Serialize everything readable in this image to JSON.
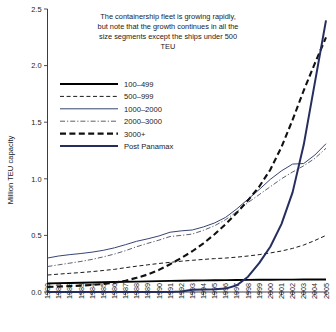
{
  "chart_data": {
    "type": "line",
    "title": "The containership fleet is growing rapidly, but note that the growth continues in all the size segments except the ships under 500 TEU",
    "title_lines": [
      "The containership fleet is growing rapidly,",
      "but note that the growth continues in all the",
      "size segments except the ships under 500",
      "TEU"
    ],
    "xlabel": "",
    "ylabel": "Million TEU capacity",
    "ylim": [
      0.0,
      2.5
    ],
    "ytick_labels": [
      "0.0",
      "0.5",
      "1.0",
      "1.5",
      "2.0",
      "2.5"
    ],
    "ytick_values": [
      0.0,
      0.5,
      1.0,
      1.5,
      2.0,
      2.5
    ],
    "grid": false,
    "legend_position": "upper-left",
    "x": [
      1980,
      1981,
      1982,
      1983,
      1984,
      1985,
      1986,
      1987,
      1988,
      1989,
      1990,
      1991,
      1992,
      1993,
      1994,
      1995,
      1996,
      1997,
      1998,
      1999,
      2000,
      2001,
      2002,
      2003,
      2004,
      2005
    ],
    "categories": [
      "1980",
      "1981",
      "1982",
      "1983",
      "1984",
      "1985",
      "1986",
      "1987",
      "1988",
      "1989",
      "1990",
      "1991",
      "1992",
      "1993",
      "1994",
      "1995",
      "1996",
      "1997",
      "1998",
      "1999",
      "2000",
      "2001",
      "2002",
      "2003",
      "2004",
      "2005"
    ],
    "series": [
      {
        "name": "100–499",
        "style": "solid-thick-black",
        "color": "#000000",
        "values": [
          0.075,
          0.078,
          0.08,
          0.082,
          0.084,
          0.086,
          0.088,
          0.09,
          0.092,
          0.094,
          0.096,
          0.098,
          0.1,
          0.102,
          0.103,
          0.104,
          0.105,
          0.106,
          0.107,
          0.108,
          0.108,
          0.109,
          0.109,
          0.11,
          0.11,
          0.11
        ]
      },
      {
        "name": "500–999",
        "style": "dashed-black",
        "color": "#1a1a1a",
        "values": [
          0.15,
          0.158,
          0.165,
          0.172,
          0.18,
          0.19,
          0.2,
          0.215,
          0.228,
          0.24,
          0.252,
          0.262,
          0.272,
          0.28,
          0.288,
          0.295,
          0.3,
          0.308,
          0.318,
          0.33,
          0.345,
          0.362,
          0.385,
          0.415,
          0.455,
          0.5
        ]
      },
      {
        "name": "1000–2000",
        "style": "solid-thin-navy",
        "color": "#2b3a6b",
        "values": [
          0.3,
          0.318,
          0.33,
          0.34,
          0.352,
          0.368,
          0.39,
          0.418,
          0.448,
          0.47,
          0.495,
          0.528,
          0.54,
          0.548,
          0.575,
          0.61,
          0.66,
          0.735,
          0.82,
          0.905,
          0.995,
          1.07,
          1.13,
          1.135,
          1.21,
          1.31
        ]
      },
      {
        "name": "2000–3000",
        "style": "dash-dot-gray",
        "color": "#555566",
        "values": [
          0.225,
          0.24,
          0.255,
          0.27,
          0.288,
          0.31,
          0.335,
          0.365,
          0.4,
          0.43,
          0.458,
          0.49,
          0.5,
          0.512,
          0.545,
          0.585,
          0.64,
          0.71,
          0.79,
          0.86,
          0.93,
          1.0,
          1.06,
          1.115,
          1.18,
          1.27
        ]
      },
      {
        "name": "3000+",
        "style": "dashed-thick-black",
        "color": "#111111",
        "values": [
          0.045,
          0.048,
          0.052,
          0.056,
          0.062,
          0.07,
          0.082,
          0.1,
          0.125,
          0.155,
          0.195,
          0.245,
          0.3,
          0.36,
          0.43,
          0.51,
          0.6,
          0.7,
          0.81,
          0.93,
          1.08,
          1.28,
          1.52,
          1.78,
          2.02,
          2.25
        ]
      },
      {
        "name": "Post Panamax",
        "style": "solid-thick-navy",
        "color": "#262e5e",
        "values": [
          0.0,
          0.0,
          0.0,
          0.0,
          0.0,
          0.0,
          0.0,
          0.0,
          0.0,
          0.0,
          0.0,
          0.0,
          0.005,
          0.02,
          0.022,
          0.024,
          0.03,
          0.06,
          0.135,
          0.255,
          0.4,
          0.6,
          0.88,
          1.3,
          1.85,
          2.4
        ]
      }
    ],
    "legend": [
      {
        "label": "100–499",
        "style": "solid-thick-black"
      },
      {
        "label": "500–999",
        "style": "dashed-black"
      },
      {
        "label": "1000–2000",
        "style": "solid-thin-navy"
      },
      {
        "label": "2000–3000",
        "style": "dash-dot-gray"
      },
      {
        "label": "3000+",
        "style": "dashed-thick-black"
      },
      {
        "label": "Post Panamax",
        "style": "solid-thick-navy"
      }
    ],
    "colors": {
      "axis": "#3a3a4a",
      "navy": "#262e5e",
      "thin_navy": "#2b3a6b",
      "gray": "#555566",
      "black": "#000000",
      "background": "#ffffff"
    }
  }
}
